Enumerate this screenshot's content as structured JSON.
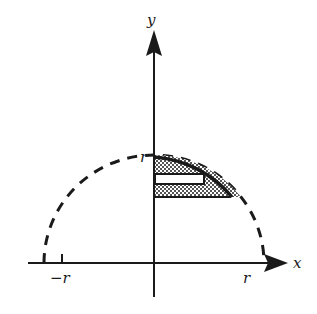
{
  "figure": {
    "type": "semicircle-volume-slice-diagram",
    "axes": {
      "x_label": "x",
      "y_label": "y"
    },
    "ticks": {
      "x_neg": "−r",
      "x_pos": "r",
      "y_pos": "r"
    },
    "elements": [
      "dashed semicircle of radius r centered at origin",
      "solid arc over first-quadrant shaded region",
      "cross-hatched (dotted) shaded region under arc",
      "white horizontal rectangular strip inside shaded region"
    ],
    "colors": {
      "stroke": "#1a1a1a",
      "fill_pattern": "#1a1a1a",
      "strip": "#ffffff",
      "background": "#ffffff"
    }
  }
}
